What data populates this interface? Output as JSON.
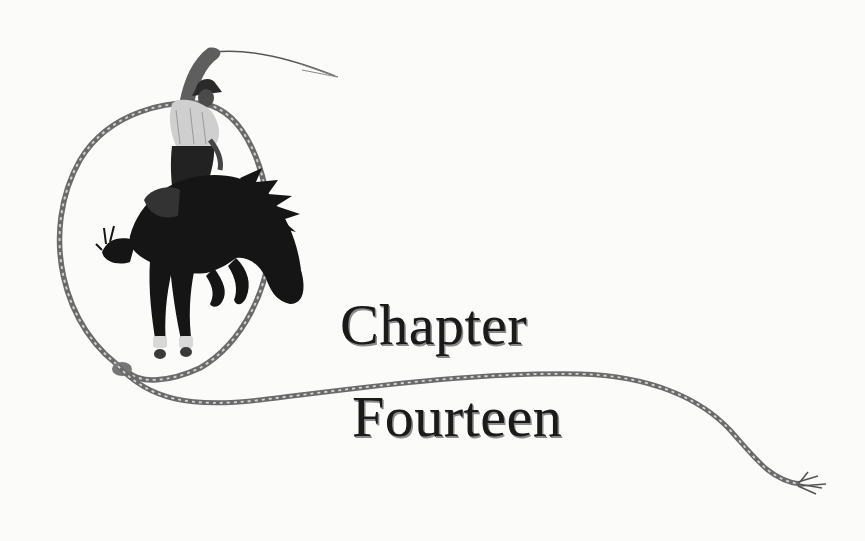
{
  "heading": {
    "line1": "Chapter",
    "line2": "Fourteen"
  },
  "illustration": {
    "subject": "bronc-rider-on-bucking-horse",
    "elements": [
      "rider-with-whip",
      "bucking-horse",
      "lasso-rope-loop",
      "rope-tail"
    ]
  },
  "colors": {
    "background": "#fbfbfa",
    "ink": "#1a1a1a",
    "rope": "#6f6f6f",
    "horse": "#151515"
  }
}
